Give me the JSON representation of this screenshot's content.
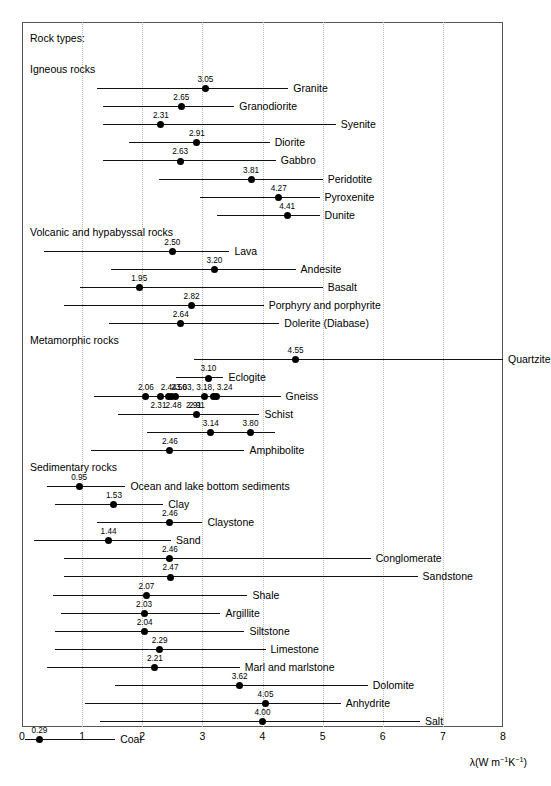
{
  "figure": {
    "legend_title": "Rock types:",
    "axis_title_prefix": "λ(W m",
    "axis_title_exp1": "−1",
    "axis_title_mid": "K",
    "axis_title_exp2": "−1",
    "axis_title_suffix": ")"
  },
  "chart_data": {
    "type": "scatter",
    "title": "Rock types:",
    "xlabel": "λ(W m−1K−1)",
    "ylabel": "",
    "xlim": [
      0,
      8
    ],
    "xticks": [
      0,
      1,
      2,
      3,
      4,
      5,
      6,
      7,
      8
    ],
    "xticklabels": [
      "0",
      "1",
      "2",
      "3",
      "4",
      "5",
      "6",
      "7",
      "8"
    ],
    "grid": "vertical-dotted",
    "legend": "none",
    "sections": [
      {
        "name": "Igneous rocks",
        "rows": [
          {
            "label": "Granite",
            "range": [
              1.25,
              4.43
            ],
            "values": [
              3.05
            ]
          },
          {
            "label": "Granodiorite",
            "range": [
              1.35,
              3.53
            ],
            "values": [
              2.65
            ]
          },
          {
            "label": "Syenite",
            "range": [
              1.35,
              5.22
            ],
            "values": [
              2.31
            ]
          },
          {
            "label": "Diorite",
            "range": [
              1.78,
              4.12
            ],
            "values": [
              2.91
            ]
          },
          {
            "label": "Gabbro",
            "range": [
              1.35,
              4.22
            ],
            "values": [
              2.63
            ]
          },
          {
            "label": "Peridotite",
            "range": [
              2.28,
              5.0
            ],
            "values": [
              3.81
            ]
          },
          {
            "label": "Pyroxenite",
            "range": [
              2.96,
              4.95
            ],
            "values": [
              4.27
            ]
          },
          {
            "label": "Dunite",
            "range": [
              3.25,
              4.95
            ],
            "values": [
              4.41
            ]
          }
        ]
      },
      {
        "name": "Volcanic and hypabyssal rocks",
        "rows": [
          {
            "label": "Lava",
            "range": [
              0.36,
              3.45
            ],
            "values": [
              2.5
            ]
          },
          {
            "label": "Andestite",
            "range": [
              1.48,
              4.55
            ],
            "values": [
              3.2
            ],
            "display": "Andesite"
          },
          {
            "label": "Basalt",
            "range": [
              0.97,
              5.0
            ],
            "values": [
              1.95
            ]
          },
          {
            "label": "Porphyry and porphyrite",
            "range": [
              0.7,
              4.02
            ],
            "values": [
              2.82
            ]
          },
          {
            "label": "Dolerite (Diabase)",
            "range": [
              1.45,
              4.28
            ],
            "values": [
              2.64
            ]
          }
        ]
      },
      {
        "name": "Metamorphic rocks",
        "rows": [
          {
            "label": "Quartzite",
            "range": [
              2.86,
              8.0
            ],
            "values": [
              4.55
            ]
          },
          {
            "label": "Eclogite",
            "range": [
              2.56,
              3.35
            ],
            "values": [
              3.1
            ]
          },
          {
            "label": "Gneiss",
            "range": [
              1.2,
              4.3
            ],
            "values": [
              2.06,
              2.31,
              2.44,
              2.48,
              2.56,
              3.03,
              3.18,
              3.24
            ],
            "label_groups": [
              {
                "text": "2.06",
                "at": 2.06,
                "level": "top"
              },
              {
                "text": "2.44",
                "at": 2.44,
                "level": "top"
              },
              {
                "text": "2.56",
                "at": 2.61,
                "level": "top"
              },
              {
                "text": "3.03, 3.18, 3.24",
                "at": 3.03,
                "level": "top"
              },
              {
                "text": "2.31",
                "at": 2.27,
                "level": "bottom"
              },
              {
                "text": "2.48",
                "at": 2.52,
                "level": "bottom"
              },
              {
                "text": "2.91",
                "at": 2.86,
                "level": "bottom"
              }
            ]
          },
          {
            "label": "Schist",
            "range": [
              1.6,
              3.95
            ],
            "values": [
              2.91
            ]
          },
          {
            "label": "Schist2",
            "range": [
              2.08,
              4.2
            ],
            "values": [
              3.14,
              3.8
            ],
            "display": ""
          },
          {
            "label": "Amphibolite",
            "range": [
              1.15,
              3.7
            ],
            "values": [
              2.46
            ]
          }
        ]
      },
      {
        "name": "Sedimentary rocks",
        "rows": [
          {
            "label": "Ocean and lake bottom sediments",
            "range": [
              0.42,
              1.72
            ],
            "values": [
              0.95
            ]
          },
          {
            "label": "Clay",
            "range": [
              0.55,
              2.35
            ],
            "values": [
              1.53
            ]
          },
          {
            "label": "Claystone",
            "range": [
              1.25,
              3.0
            ],
            "values": [
              2.46
            ]
          },
          {
            "label": "Sand",
            "range": [
              0.2,
              2.48
            ],
            "values": [
              1.44
            ]
          },
          {
            "label": "Conglomerate",
            "range": [
              0.7,
              5.8
            ],
            "values": [
              2.46
            ]
          },
          {
            "label": "Sandstone",
            "range": [
              0.7,
              6.58
            ],
            "values": [
              2.47
            ]
          },
          {
            "label": "Shale",
            "range": [
              0.52,
              3.75
            ],
            "values": [
              2.07
            ]
          },
          {
            "label": "Argillite",
            "range": [
              0.65,
              3.3
            ],
            "values": [
              2.03
            ]
          },
          {
            "label": "Siltstone",
            "range": [
              0.55,
              3.7
            ],
            "values": [
              2.04
            ]
          },
          {
            "label": "Limestone",
            "range": [
              0.55,
              4.05
            ],
            "values": [
              2.29
            ]
          },
          {
            "label": "Marl and marlstone",
            "range": [
              0.42,
              3.62
            ],
            "values": [
              2.21
            ]
          },
          {
            "label": "Dolomite",
            "range": [
              1.55,
              5.75
            ],
            "values": [
              3.62
            ]
          },
          {
            "label": "Anhydrite",
            "range": [
              1.05,
              5.3
            ],
            "values": [
              4.05
            ]
          },
          {
            "label": "Salt",
            "range": [
              1.3,
              6.62
            ],
            "values": [
              4.0
            ]
          },
          {
            "label": "Coal",
            "range": [
              0.05,
              1.55
            ],
            "values": [
              0.29
            ]
          }
        ]
      }
    ]
  }
}
